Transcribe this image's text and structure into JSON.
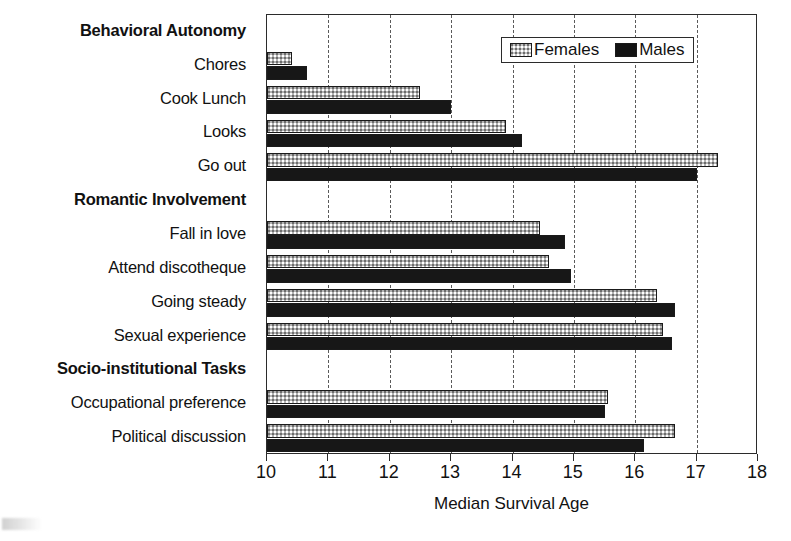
{
  "chart_data": {
    "type": "bar",
    "orientation": "horizontal",
    "title": "",
    "xlabel": "Median Survival Age",
    "ylabel": "",
    "xlim": [
      10,
      18
    ],
    "xticks": [
      10,
      11,
      12,
      13,
      14,
      15,
      16,
      17,
      18
    ],
    "xtick_labels": [
      "10",
      "11",
      "12",
      "13",
      "14",
      "15",
      "16",
      "17",
      "18"
    ],
    "grid": "vertical dashed gridlines at each integer tick",
    "legend": {
      "position": "top-right inside plot",
      "entries": [
        {
          "name": "Females",
          "swatch": "light-gray-dotted"
        },
        {
          "name": "Males",
          "swatch": "black"
        }
      ]
    },
    "series": [
      {
        "name": "Females",
        "color": "#b4b4b4"
      },
      {
        "name": "Males",
        "color": "#171717"
      }
    ],
    "groups": [
      {
        "header": "Behavioral Autonomy",
        "rows": [
          {
            "category": "Chores",
            "Females": 10.4,
            "Males": 10.65
          },
          {
            "category": "Cook Lunch",
            "Females": 12.5,
            "Males": 13.0
          },
          {
            "category": "Looks",
            "Females": 13.9,
            "Males": 14.15
          },
          {
            "category": "Go out",
            "Females": 17.35,
            "Males": 17.0
          }
        ]
      },
      {
        "header": "Romantic Involvement",
        "rows": [
          {
            "category": "Fall in love",
            "Females": 14.45,
            "Males": 14.85
          },
          {
            "category": "Attend discotheque",
            "Females": 14.6,
            "Males": 14.95
          },
          {
            "category": "Going steady",
            "Females": 16.35,
            "Males": 16.65
          },
          {
            "category": "Sexual experience",
            "Females": 16.45,
            "Males": 16.6
          }
        ]
      },
      {
        "header": "Socio-institutional Tasks",
        "rows": [
          {
            "category": "Occupational preference",
            "Females": 15.55,
            "Males": 15.5
          },
          {
            "category": "Political discussion",
            "Females": 16.65,
            "Males": 16.15
          }
        ]
      }
    ]
  },
  "axis": {
    "x_title": "Median Survival Age"
  },
  "legend": {
    "females_label": "Females",
    "males_label": "Males"
  },
  "labels": {
    "group_1": "Behavioral Autonomy",
    "group_2": "Romantic Involvement",
    "group_3": "Socio-institutional Tasks",
    "chores": "Chores",
    "cook_lunch": "Cook Lunch",
    "looks": "Looks",
    "go_out": "Go out",
    "fall_in_love": "Fall in love",
    "attend_discotheque": "Attend discotheque",
    "going_steady": "Going steady",
    "sexual_experience": "Sexual experience",
    "occupational_preference": "Occupational preference",
    "political_discussion": "Political discussion"
  },
  "colors": {
    "females": "#b4b4b4",
    "males": "#171717",
    "axis": "#2b2b2b",
    "grid": "#5a5a5a"
  }
}
